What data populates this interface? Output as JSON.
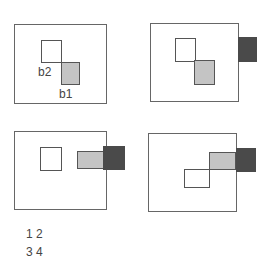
{
  "panels": [
    {
      "id": 1,
      "labels": {
        "b2": "b2",
        "b1": "b1"
      }
    },
    {
      "id": 2
    },
    {
      "id": 3
    },
    {
      "id": 4
    }
  ],
  "legend": {
    "row1": "1 2",
    "row2": "3 4"
  },
  "colors": {
    "frame": "#666666",
    "gray_box": "#c4c4c4",
    "dark_box": "#4a4a4a"
  }
}
